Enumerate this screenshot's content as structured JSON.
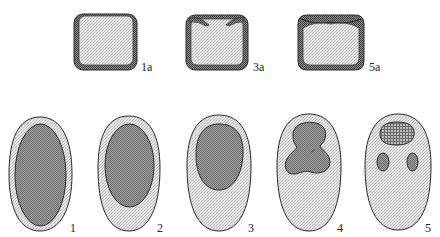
{
  "figure": {
    "top_row": [
      {
        "id": "1a",
        "label": "1a",
        "shape": "rounded-square-frame",
        "top_edge": "flat"
      },
      {
        "id": "3a",
        "label": "3a",
        "shape": "rounded-square-frame",
        "top_edge": "inward-folding flaps"
      },
      {
        "id": "5a",
        "label": "5a",
        "shape": "rounded-square-frame",
        "top_edge": "concave depression"
      }
    ],
    "bottom_row": [
      {
        "id": "1",
        "label": "1",
        "inner": "large oval filling body"
      },
      {
        "id": "2",
        "label": "2",
        "inner": "oval in upper two-thirds"
      },
      {
        "id": "3",
        "label": "3",
        "inner": "smaller oval in upper half"
      },
      {
        "id": "4",
        "label": "4",
        "inner": "tri-lobed blob in upper half"
      },
      {
        "id": "5",
        "label": "5",
        "inner": "cross-hatched top oval and two small lateral ovals"
      }
    ],
    "colors": {
      "outline": "#2a2a2a",
      "light_fill": "#dcdcdc",
      "dark_fill": "#8a8a8a",
      "frame": "#6e6e6e",
      "background": "#ffffff"
    }
  }
}
